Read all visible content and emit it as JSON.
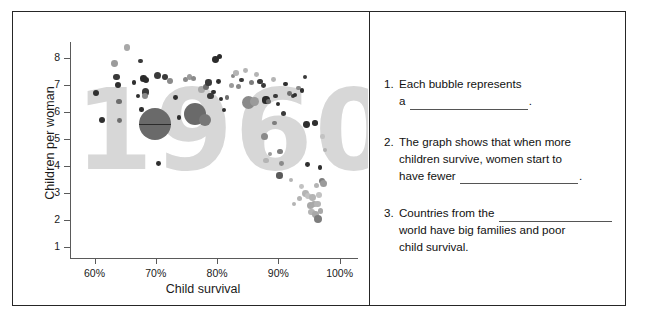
{
  "worksheet": {
    "title": "Child survival and children per woman worksheet"
  },
  "chart_data": {
    "type": "scatter",
    "title": "1960",
    "watermark": "1960",
    "xlabel": "Child survival",
    "ylabel": "Children per woman",
    "xticks": [
      "60%",
      "70%",
      "80%",
      "90%",
      "100%"
    ],
    "xtick_values": [
      60,
      70,
      80,
      90,
      100
    ],
    "yticks": [
      "1",
      "2",
      "3",
      "4",
      "5",
      "6",
      "7",
      "8"
    ],
    "ytick_values": [
      1,
      2,
      3,
      4,
      5,
      6,
      7,
      8
    ],
    "xlim": [
      56,
      103
    ],
    "ylim": [
      0.6,
      8.6
    ],
    "grid": false,
    "legend": false,
    "bubble_meaning": "Each bubble is a country; bubble size is population",
    "colors": {
      "bubble_dark": "#3a3a3a",
      "bubble_mid": "#707070",
      "bubble_light": "#b4b4b4",
      "bubble_pale": "#cfcfcf",
      "watermark": "#d7d7d7",
      "axis": "#5a5a5a",
      "frame": "#262626"
    },
    "points": [
      {
        "x": 60.2,
        "y": 6.7,
        "r": 3.0,
        "c": "#2f2f2f"
      },
      {
        "x": 61.2,
        "y": 5.7,
        "r": 3.2,
        "c": "#2f2f2f"
      },
      {
        "x": 63.3,
        "y": 7.8,
        "r": 3.4,
        "c": "#9b9b9b"
      },
      {
        "x": 63.6,
        "y": 7.3,
        "r": 3.2,
        "c": "#3a3a3a"
      },
      {
        "x": 63.9,
        "y": 7.0,
        "r": 3.0,
        "c": "#2f2f2f"
      },
      {
        "x": 64.0,
        "y": 6.4,
        "r": 2.6,
        "c": "#6e6e6e"
      },
      {
        "x": 64.1,
        "y": 5.7,
        "r": 2.4,
        "c": "#6e6e6e"
      },
      {
        "x": 65.3,
        "y": 8.4,
        "r": 3.4,
        "c": "#a8a8a8"
      },
      {
        "x": 66.4,
        "y": 7.1,
        "r": 2.2,
        "c": "#2f2f2f"
      },
      {
        "x": 67.1,
        "y": 6.6,
        "r": 2.4,
        "c": "#2f2f2f"
      },
      {
        "x": 67.5,
        "y": 7.9,
        "r": 2.3,
        "c": "#3a3a3a"
      },
      {
        "x": 68.0,
        "y": 7.25,
        "r": 3.3,
        "c": "#2b2b2b"
      },
      {
        "x": 68.4,
        "y": 7.2,
        "r": 3.0,
        "c": "#2b2b2b"
      },
      {
        "x": 68.3,
        "y": 6.75,
        "r": 3.6,
        "c": "#3a3a3a"
      },
      {
        "x": 68.2,
        "y": 6.6,
        "r": 3.2,
        "c": "#8a8a8a"
      },
      {
        "x": 67.7,
        "y": 6.1,
        "r": 2.2,
        "c": "#2f2f2f"
      },
      {
        "x": 67.9,
        "y": 5.75,
        "r": 2.0,
        "c": "#2f2f2f"
      },
      {
        "x": 69.8,
        "y": 5.55,
        "r": 16.0,
        "c": "#6a6a6a",
        "marker_line": true
      },
      {
        "x": 70.3,
        "y": 7.35,
        "r": 3.6,
        "c": "#3a3a3a"
      },
      {
        "x": 71.5,
        "y": 7.3,
        "r": 3.2,
        "c": "#3a3a3a"
      },
      {
        "x": 70.4,
        "y": 4.1,
        "r": 2.4,
        "c": "#2f2f2f"
      },
      {
        "x": 72.3,
        "y": 7.15,
        "r": 3.2,
        "c": "#8a8a8a"
      },
      {
        "x": 73.2,
        "y": 6.55,
        "r": 2.4,
        "c": "#2f2f2f"
      },
      {
        "x": 73.8,
        "y": 5.8,
        "r": 2.2,
        "c": "#2f2f2f"
      },
      {
        "x": 74.8,
        "y": 7.2,
        "r": 2.6,
        "c": "#8a8a8a"
      },
      {
        "x": 75.5,
        "y": 7.3,
        "r": 2.8,
        "c": "#9b9b9b"
      },
      {
        "x": 76.2,
        "y": 7.25,
        "r": 2.6,
        "c": "#8a8a8a"
      },
      {
        "x": 76.4,
        "y": 5.95,
        "r": 11.0,
        "c": "#6a6a6a"
      },
      {
        "x": 78.1,
        "y": 5.7,
        "r": 6.0,
        "c": "#777777"
      },
      {
        "x": 77.5,
        "y": 6.85,
        "r": 3.6,
        "c": "#a8a8a8"
      },
      {
        "x": 78.2,
        "y": 6.95,
        "r": 3.0,
        "c": "#6e6e6e"
      },
      {
        "x": 78.6,
        "y": 7.1,
        "r": 3.2,
        "c": "#3a3a3a"
      },
      {
        "x": 78.9,
        "y": 6.6,
        "r": 3.4,
        "c": "#3a3a3a"
      },
      {
        "x": 79.4,
        "y": 6.75,
        "r": 2.4,
        "c": "#2f2f2f"
      },
      {
        "x": 79.8,
        "y": 7.95,
        "r": 3.4,
        "c": "#2b2b2b"
      },
      {
        "x": 80.4,
        "y": 8.05,
        "r": 2.6,
        "c": "#2b2b2b"
      },
      {
        "x": 80.2,
        "y": 7.15,
        "r": 2.4,
        "c": "#2f2f2f"
      },
      {
        "x": 80.6,
        "y": 6.5,
        "r": 2.0,
        "c": "#2f2f2f"
      },
      {
        "x": 81.2,
        "y": 6.1,
        "r": 2.0,
        "c": "#2f2f2f"
      },
      {
        "x": 81.6,
        "y": 6.55,
        "r": 2.2,
        "c": "#6e6e6e"
      },
      {
        "x": 82.3,
        "y": 7.0,
        "r": 2.6,
        "c": "#9b9b9b"
      },
      {
        "x": 82.6,
        "y": 7.35,
        "r": 2.2,
        "c": "#8a8a8a"
      },
      {
        "x": 83.1,
        "y": 7.45,
        "r": 2.8,
        "c": "#b4b4b4"
      },
      {
        "x": 83.5,
        "y": 6.95,
        "r": 2.6,
        "c": "#8a8a8a"
      },
      {
        "x": 84.0,
        "y": 7.2,
        "r": 2.2,
        "c": "#3a3a3a"
      },
      {
        "x": 84.6,
        "y": 7.55,
        "r": 2.4,
        "c": "#b4b4b4"
      },
      {
        "x": 85.2,
        "y": 6.35,
        "r": 6.5,
        "c": "#8a8a8a"
      },
      {
        "x": 86.1,
        "y": 6.4,
        "r": 4.6,
        "c": "#9b9b9b"
      },
      {
        "x": 85.6,
        "y": 7.1,
        "r": 2.8,
        "c": "#7d7d7d"
      },
      {
        "x": 86.5,
        "y": 7.4,
        "r": 2.4,
        "c": "#b4b4b4"
      },
      {
        "x": 87.0,
        "y": 7.15,
        "r": 2.6,
        "c": "#3a3a3a"
      },
      {
        "x": 87.6,
        "y": 7.0,
        "r": 2.4,
        "c": "#3a3a3a"
      },
      {
        "x": 88.0,
        "y": 6.45,
        "r": 3.6,
        "c": "#2b2b2b"
      },
      {
        "x": 88.4,
        "y": 6.4,
        "r": 2.6,
        "c": "#6e6e6e"
      },
      {
        "x": 87.8,
        "y": 5.1,
        "r": 3.6,
        "c": "#8a8a8a"
      },
      {
        "x": 88.6,
        "y": 4.45,
        "r": 2.2,
        "c": "#9b9b9b"
      },
      {
        "x": 88.0,
        "y": 4.2,
        "r": 2.6,
        "c": "#b4b4b4"
      },
      {
        "x": 89.2,
        "y": 7.2,
        "r": 2.4,
        "c": "#b4b4b4"
      },
      {
        "x": 89.6,
        "y": 6.6,
        "r": 2.4,
        "c": "#3a3a3a"
      },
      {
        "x": 89.9,
        "y": 6.3,
        "r": 2.0,
        "c": "#2f2f2f"
      },
      {
        "x": 89.4,
        "y": 5.6,
        "r": 2.2,
        "c": "#7d7d7d"
      },
      {
        "x": 90.3,
        "y": 4.55,
        "r": 2.8,
        "c": "#7d7d7d"
      },
      {
        "x": 90.5,
        "y": 4.1,
        "r": 2.4,
        "c": "#8a8a8a"
      },
      {
        "x": 90.2,
        "y": 3.65,
        "r": 3.2,
        "c": "#5a5a5a"
      },
      {
        "x": 90.8,
        "y": 5.95,
        "r": 2.6,
        "c": "#3a3a3a"
      },
      {
        "x": 91.2,
        "y": 7.05,
        "r": 2.2,
        "c": "#2f2f2f"
      },
      {
        "x": 91.8,
        "y": 6.7,
        "r": 2.4,
        "c": "#6e6e6e"
      },
      {
        "x": 92.4,
        "y": 6.6,
        "r": 2.2,
        "c": "#3a3a3a"
      },
      {
        "x": 92.8,
        "y": 6.65,
        "r": 2.0,
        "c": "#2f2f2f"
      },
      {
        "x": 93.3,
        "y": 6.9,
        "r": 2.4,
        "c": "#8a8a8a"
      },
      {
        "x": 93.9,
        "y": 6.8,
        "r": 2.2,
        "c": "#2f2f2f"
      },
      {
        "x": 94.4,
        "y": 7.3,
        "r": 2.2,
        "c": "#3a3a3a"
      },
      {
        "x": 92.1,
        "y": 3.5,
        "r": 2.2,
        "c": "#b4b4b4"
      },
      {
        "x": 92.6,
        "y": 2.6,
        "r": 2.0,
        "c": "#b4b4b4"
      },
      {
        "x": 93.4,
        "y": 2.8,
        "r": 2.6,
        "c": "#b4b4b4"
      },
      {
        "x": 93.8,
        "y": 3.25,
        "r": 2.4,
        "c": "#c2c2c2"
      },
      {
        "x": 94.6,
        "y": 5.55,
        "r": 3.4,
        "c": "#2f2f2f"
      },
      {
        "x": 94.8,
        "y": 4.05,
        "r": 2.4,
        "c": "#2f2f2f"
      },
      {
        "x": 94.4,
        "y": 3.0,
        "r": 3.4,
        "c": "#b4b4b4"
      },
      {
        "x": 94.9,
        "y": 2.9,
        "r": 3.0,
        "c": "#c2c2c2"
      },
      {
        "x": 95.2,
        "y": 2.55,
        "r": 3.6,
        "c": "#a8a8a8"
      },
      {
        "x": 95.6,
        "y": 2.85,
        "r": 3.4,
        "c": "#b4b4b4"
      },
      {
        "x": 95.9,
        "y": 2.6,
        "r": 3.0,
        "c": "#a8a8a8"
      },
      {
        "x": 95.4,
        "y": 2.3,
        "r": 3.2,
        "c": "#b4b4b4"
      },
      {
        "x": 96.0,
        "y": 2.2,
        "r": 3.4,
        "c": "#a8a8a8"
      },
      {
        "x": 96.4,
        "y": 2.6,
        "r": 3.2,
        "c": "#b4b4b4"
      },
      {
        "x": 96.6,
        "y": 2.95,
        "r": 3.0,
        "c": "#c2c2c2"
      },
      {
        "x": 96.2,
        "y": 3.3,
        "r": 2.6,
        "c": "#b4b4b4"
      },
      {
        "x": 96.9,
        "y": 2.35,
        "r": 2.8,
        "c": "#a8a8a8"
      },
      {
        "x": 96.5,
        "y": 2.05,
        "r": 4.2,
        "c": "#7d7d7d"
      },
      {
        "x": 97.1,
        "y": 3.45,
        "r": 3.0,
        "c": "#7d7d7d"
      },
      {
        "x": 97.4,
        "y": 3.35,
        "r": 3.6,
        "c": "#9b9b9b"
      },
      {
        "x": 96.8,
        "y": 3.95,
        "r": 2.2,
        "c": "#2f2f2f"
      },
      {
        "x": 97.6,
        "y": 4.6,
        "r": 2.0,
        "c": "#b4b4b4"
      },
      {
        "x": 97.2,
        "y": 5.1,
        "r": 2.2,
        "c": "#c2c2c2"
      },
      {
        "x": 96.0,
        "y": 5.6,
        "r": 2.8,
        "c": "#2f2f2f"
      }
    ]
  },
  "questions": [
    {
      "number": "1.",
      "lines": [
        {
          "text": "Each bubble represents"
        },
        {
          "text_before": "a ",
          "blank": "blank-a",
          "text_after": "."
        }
      ]
    },
    {
      "number": "2.",
      "lines": [
        {
          "text": "The graph shows that when more"
        },
        {
          "text": "children survive, women start to"
        },
        {
          "text_before": "have fewer ",
          "blank": "blank-fewer",
          "text_after": "."
        }
      ]
    },
    {
      "number": "3.",
      "lines": [
        {
          "text_before": "Countries from the ",
          "blank": "blank-from",
          "text_after": ""
        },
        {
          "text": "world have big families and poor"
        },
        {
          "text": "child survival."
        }
      ]
    }
  ],
  "q1_num": "1.",
  "q1_l1": "Each bubble represents",
  "q1_l2a": "a ",
  "q1_l2b": ".",
  "q2_num": "2.",
  "q2_l1": "The graph shows that when more",
  "q2_l2": "children survive, women start to",
  "q2_l3a": "have fewer ",
  "q2_l3b": ".",
  "q3_num": "3.",
  "q3_l1a": "Countries from the ",
  "q3_l1b": "",
  "q3_l2": "world have big families and poor",
  "q3_l3": "child survival."
}
